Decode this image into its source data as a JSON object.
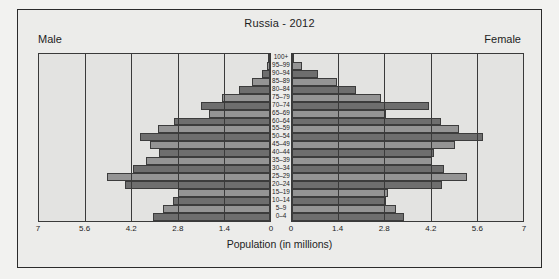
{
  "figure": {
    "title": "Russia - 2012",
    "male_label": "Male",
    "female_label": "Female",
    "xlabel": "Population (in millions)",
    "colors": {
      "background": "#ececea",
      "panel": "#e3e3e1",
      "bar_dark": "#6e6e6e",
      "bar_light": "#949494",
      "frame": "#2b2b2b"
    }
  },
  "chart_data": {
    "type": "bar",
    "subtype": "population-pyramid",
    "title": "Russia - 2012",
    "xlabel": "Population (in millions)",
    "ylabel": "",
    "xlim": [
      0,
      7
    ],
    "xticks": [
      "7",
      "5.6",
      "4.2",
      "2.8",
      "1.4",
      "0"
    ],
    "xticks_right": [
      "0",
      "1.4",
      "2.8",
      "4.2",
      "5.6",
      "7"
    ],
    "grid": true,
    "legend": [
      "Male",
      "Female"
    ],
    "legend_position": "top-corners",
    "categories": [
      "100+",
      "95–99",
      "90–94",
      "85–89",
      "80–84",
      "75–79",
      "70–74",
      "65–69",
      "60–64",
      "55–59",
      "50–54",
      "45–49",
      "40–44",
      "35–39",
      "30–34",
      "25–29",
      "20–24",
      "15–19",
      "10–14",
      "5–9",
      "0–4"
    ],
    "series": [
      {
        "name": "Male",
        "values": [
          0.02,
          0.1,
          0.25,
          0.55,
          0.95,
          1.45,
          2.1,
          1.85,
          2.9,
          3.4,
          3.95,
          3.65,
          3.35,
          3.75,
          4.15,
          4.95,
          4.4,
          2.8,
          2.95,
          3.25,
          3.55
        ]
      },
      {
        "name": "Female",
        "values": [
          0.06,
          0.3,
          0.8,
          1.35,
          1.95,
          2.7,
          4.15,
          2.85,
          4.5,
          5.05,
          5.8,
          4.95,
          4.3,
          4.25,
          4.6,
          5.3,
          4.55,
          2.9,
          2.85,
          3.15,
          3.4
        ]
      }
    ]
  }
}
